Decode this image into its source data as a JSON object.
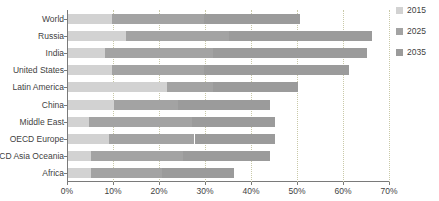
{
  "chart_data": {
    "type": "bar",
    "orientation": "horizontal",
    "stacked": true,
    "title": "",
    "xlabel": "",
    "ylabel": "",
    "xlim": [
      0,
      70
    ],
    "xticks": [
      0,
      10,
      20,
      30,
      40,
      50,
      60,
      70
    ],
    "xtick_labels": [
      "0%",
      "10%",
      "20%",
      "30%",
      "40%",
      "50%",
      "60%",
      "70%"
    ],
    "grid": "vertical-dotted",
    "legend_position": "right",
    "categories": [
      "World",
      "Russia",
      "India",
      "United States",
      "Latin America",
      "China",
      "Middle East",
      "OECD Europe",
      "OECD Asia Oceania",
      "Africa"
    ],
    "series": [
      {
        "name": "2015",
        "color": "#d2d2d2",
        "values": [
          9.5,
          12.5,
          8.0,
          9.5,
          21.5,
          10.0,
          4.5,
          9.0,
          5.0,
          5.0
        ]
      },
      {
        "name": "2025",
        "color": "#a3a3a3",
        "values": [
          20.0,
          22.5,
          23.5,
          20.0,
          10.0,
          14.0,
          22.5,
          18.5,
          20.0,
          15.5
        ]
      },
      {
        "name": "2035",
        "color": "#9b9b9b",
        "values": [
          21.0,
          31.0,
          33.5,
          31.5,
          18.5,
          20.0,
          18.0,
          17.5,
          19.0,
          15.5
        ]
      }
    ],
    "totals": [
      50.5,
      66.0,
      65.0,
      61.0,
      50.0,
      44.0,
      45.0,
      45.0,
      44.0,
      36.0
    ]
  },
  "legend": {
    "items": [
      {
        "label": "2015",
        "color": "#d2d2d2"
      },
      {
        "label": "2025",
        "color": "#a3a3a3"
      },
      {
        "label": "2035",
        "color": "#9b9b9b"
      }
    ]
  }
}
